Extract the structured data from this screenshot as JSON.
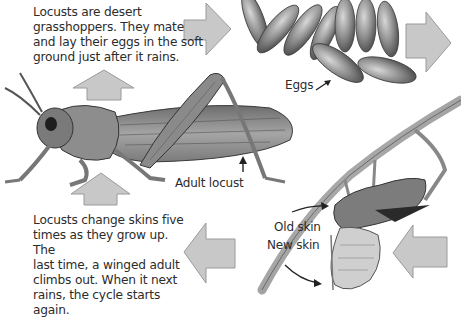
{
  "captions": {
    "top": [
      "Locusts are desert",
      "grasshoppers. They mate",
      "and lay their eggs in the soft",
      "ground just after it rains."
    ],
    "bottom": [
      "Locusts change skins five",
      "times as they grow up. The",
      "last time, a winged adult",
      "climbs out. When it next",
      "rains, the cycle starts again."
    ]
  },
  "labels": {
    "eggs": "Eggs",
    "adult": "Adult locust",
    "old_skin": "Old skin",
    "new_skin": "New skin"
  },
  "stages": [
    "Adult locust",
    "Eggs",
    "Old skin / New skin (moulting)"
  ],
  "colors": {
    "arrow_fill": "#c8c8c8",
    "arrow_stroke": "#9a9a9a",
    "egg_fill": "#8a8a8a",
    "locust_body": "#9b9b9b",
    "text": "#2c2c2c"
  }
}
